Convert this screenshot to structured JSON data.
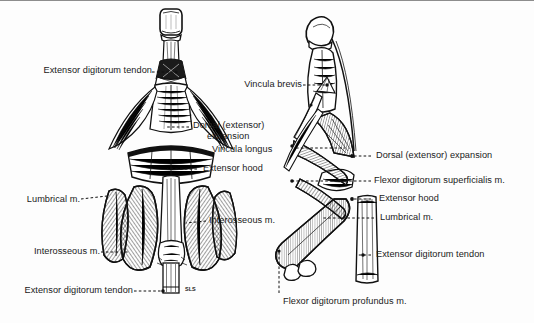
{
  "figure": {
    "background_color": "#fdfdfd",
    "ink_color": "#111111",
    "border_color": "#8d8d8d",
    "signature": "SLS"
  },
  "views": {
    "dorsal": {
      "name": "dorsal-view-figure",
      "position": "left"
    },
    "lateral": {
      "name": "lateral-view-figure",
      "position": "right"
    }
  },
  "labels": {
    "left_view": [
      {
        "id": "extensor-digitorum-tendon-top",
        "text": "Extensor digitorum tendon",
        "align": "right",
        "x": 12,
        "y": 62,
        "leader_from": [
          152,
          71
        ],
        "leader_to": [
          176,
          71
        ]
      },
      {
        "id": "dorsal-extensor-expansion",
        "text": "Dorsal (extensor)\nexpansion",
        "align": "left",
        "x": 193,
        "y": 120,
        "leader_from": [
          189,
          126
        ],
        "leader_to": [
          166,
          126
        ]
      },
      {
        "id": "vincula-longus",
        "text": "Vincula longus",
        "align": "left",
        "x": 205,
        "y": 145,
        "leader_from": null,
        "leader_to": null
      },
      {
        "id": "extensor-hood",
        "text": "Extensor hood",
        "align": "left",
        "x": 201,
        "y": 163,
        "leader_from": [
          197,
          168
        ],
        "leader_to": [
          167,
          168
        ]
      },
      {
        "id": "lumbrical-m",
        "text": "Lumbrical m.",
        "align": "right",
        "x": 16,
        "y": 194,
        "leader_from": [
          81,
          200
        ],
        "leader_to": [
          105,
          196
        ]
      },
      {
        "id": "interosseous-m-right",
        "text": "Interosseous m.",
        "align": "left",
        "x": 209,
        "y": 215,
        "leader_from": [
          206,
          220
        ],
        "leader_to": [
          188,
          222
        ]
      },
      {
        "id": "interosseous-m-left",
        "text": "Interosseous m.",
        "align": "right",
        "x": 16,
        "y": 245,
        "leader_from": [
          101,
          251
        ],
        "leader_to": [
          126,
          251
        ]
      },
      {
        "id": "extensor-digitorum-tendon-bottom",
        "text": "Extensor digitorum tendon",
        "align": "right",
        "x": 12,
        "y": 284,
        "leader_from": [
          134,
          290
        ],
        "leader_to": [
          163,
          290
        ]
      }
    ],
    "right_view": [
      {
        "id": "vincula-brevis",
        "text": "Vincula brevis",
        "align": "right",
        "x": 235,
        "y": 77,
        "leader_from": [
          303,
          84
        ],
        "leader_to": [
          326,
          84
        ]
      },
      {
        "id": "dorsal-extensor-expansion-lat",
        "text": "Dorsal (extensor) expansion",
        "align": "left",
        "x": 374,
        "y": 150,
        "leader_from": [
          371,
          155
        ],
        "leader_to": [
          352,
          155
        ]
      },
      {
        "id": "flexor-digitorum-superficialis-m",
        "text": "Flexor digitorum superficialis m.",
        "align": "left",
        "x": 374,
        "y": 175,
        "leader_from": [
          371,
          180
        ],
        "leader_to": [
          290,
          180
        ]
      },
      {
        "id": "extensor-hood-lat",
        "text": "Extensor hood",
        "align": "left",
        "x": 379,
        "y": 193,
        "leader_from": [
          371,
          198
        ],
        "leader_to": [
          352,
          198
        ]
      },
      {
        "id": "lumbrical-m-lat",
        "text": "Lumbrical m.",
        "align": "left",
        "x": 379,
        "y": 212,
        "leader_from": [
          374,
          217
        ],
        "leader_to": [
          322,
          217
        ]
      },
      {
        "id": "extensor-digitorum-tendon-lat",
        "text": "Extensor digitorum tendon",
        "align": "left",
        "x": 374,
        "y": 249,
        "leader_from": [
          371,
          254
        ],
        "leader_to": [
          356,
          254
        ]
      },
      {
        "id": "flexor-digitorum-profundus-m",
        "text": "Flexor digitorum profundus m.",
        "align": "left",
        "x": 283,
        "y": 298,
        "leader_from": [
          279,
          292
        ],
        "leader_to": [
          279,
          252
        ]
      }
    ]
  }
}
